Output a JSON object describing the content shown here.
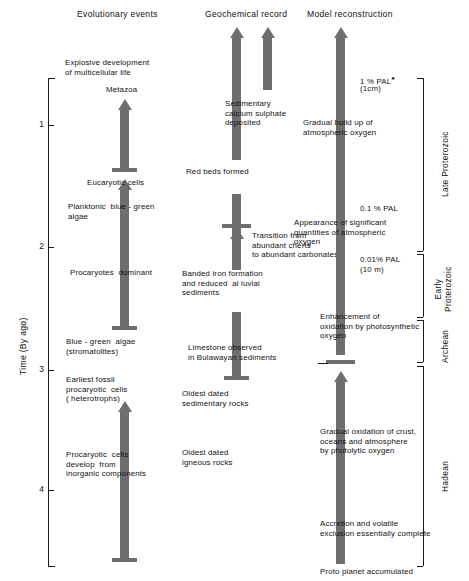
{
  "figure": {
    "title_columns": [
      {
        "id": "evolutionary-events",
        "label": "Evolutionary events"
      },
      {
        "id": "geochemical-record",
        "label": "Geochemical record"
      },
      {
        "id": "model-reconstruction",
        "label": "Model reconstruction"
      }
    ],
    "axis": {
      "title": "Time (By ago)",
      "ticks": [
        {
          "value": "1",
          "y": 125
        },
        {
          "value": "2",
          "y": 247
        },
        {
          "value": "3",
          "y": 370
        },
        {
          "value": "4",
          "y": 490
        }
      ],
      "range_top_label": "0",
      "range_bottom_label": "4.6",
      "units": "By ago"
    },
    "eras": [
      {
        "id": "late-proterozoic",
        "label": "Late Proterozoic",
        "lines": [
          "Late Proterozoic"
        ]
      },
      {
        "id": "early-proterozoic",
        "label": "Early Proterozoic",
        "lines": [
          "Early",
          "Proterozoic"
        ]
      },
      {
        "id": "archean",
        "label": "Archean",
        "lines": [
          "Archean"
        ]
      },
      {
        "id": "hadean",
        "label": "Hadean",
        "lines": [
          "Hadean"
        ]
      }
    ],
    "evolutionary_events": [
      {
        "id": "explosive-development",
        "text": "Explosive development\nof multicellular life"
      },
      {
        "id": "metazoa",
        "text": "Metazoa"
      },
      {
        "id": "eucaryotic-cells",
        "text": "Eucaryotic cells"
      },
      {
        "id": "planktonic-blue-green-algae",
        "text": "Planktonic  blue - green\nalgae"
      },
      {
        "id": "procaryotes-dominant",
        "text": "Procaryotes  dominant"
      },
      {
        "id": "blue-green-algae-stromatolites",
        "text": "Blue - green  algae\n(stromatolites)"
      },
      {
        "id": "earliest-fossil-procaryotic-cells",
        "text": "Earliest fossil\nprocaryotic  cells\n( heterotrophs)"
      },
      {
        "id": "procaryotic-cells-develop",
        "text": "Procaryotic  cells\ndevelop  from\ninorganic components"
      }
    ],
    "geochemical_record": [
      {
        "id": "sedimentary-calcium-sulphate",
        "text": "Sedimentary\ncalcium sulphate\ndeposited"
      },
      {
        "id": "red-beds-formed",
        "text": "Red beds formed"
      },
      {
        "id": "transition-cherts-carbonates",
        "text": "Transition from\nabundant cherts\nto abundant carbonates"
      },
      {
        "id": "banded-iron-formation",
        "text": "Banded iron formation\nand reduced  al luvial\nsediments"
      },
      {
        "id": "limestone-bulawayan",
        "text": "Limestone observed\nin Bulawayan sediments"
      },
      {
        "id": "oldest-dated-sedimentary-rocks",
        "text": "Oldest dated\nsedimentary rocks"
      },
      {
        "id": "oldest-dated-igneous-rocks",
        "text": "Oldest dated\nigneous rocks"
      }
    ],
    "model_reconstruction": [
      {
        "id": "pal-1-percent",
        "text": "1 % PAL",
        "sub": "(1cm)",
        "starred": true
      },
      {
        "id": "gradual-build-up-oxygen",
        "text": "Gradual build up of\natmospheric oxygen"
      },
      {
        "id": "pal-0-1-percent",
        "text": "0.1 % PAL",
        "sub": "",
        "starred": false
      },
      {
        "id": "appearance-significant-oxygen",
        "text": "Appearance of significant\nquantities of atmospheric\noxygen"
      },
      {
        "id": "pal-0-01-percent",
        "text": "0.01% PAL",
        "sub": "(10 m)",
        "starred": false
      },
      {
        "id": "enhancement-oxidation",
        "text": "Enhancement of\noxidation by photosynthetic\noxygen"
      },
      {
        "id": "gradual-oxidation-crust",
        "text": "Gradual oxidation of crust,\noceans and atmosphere\nby photolytic oxygen"
      },
      {
        "id": "accretion-volatile-exclusion",
        "text": "Accretion and volatile\nexclusion essentially complete"
      },
      {
        "id": "proto-planet-accumulated",
        "text": "Proto planet accumulated"
      }
    ],
    "colors": {
      "arrow": "#6e6e6e",
      "line": "#1a1a1a",
      "text": "#111111",
      "background": "#ffffff"
    }
  }
}
